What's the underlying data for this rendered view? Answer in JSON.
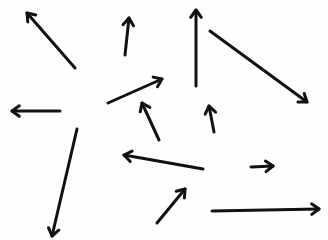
{
  "figure": {
    "background_color": "#ffffff",
    "stroke_color": "#111111",
    "arrow_count": 13
  },
  "arrows": [
    {
      "id": 1,
      "direction": "up-left",
      "tail": [
        75,
        68
      ],
      "head": [
        27,
        13
      ]
    },
    {
      "id": 2,
      "direction": "up",
      "tail": [
        125,
        55
      ],
      "head": [
        129,
        18
      ]
    },
    {
      "id": 3,
      "direction": "up",
      "tail": [
        196,
        86
      ],
      "head": [
        196,
        10
      ]
    },
    {
      "id": 4,
      "direction": "down-right",
      "tail": [
        210,
        31
      ],
      "head": [
        307,
        102
      ]
    },
    {
      "id": 5,
      "direction": "left",
      "tail": [
        60,
        111
      ],
      "head": [
        12,
        111
      ]
    },
    {
      "id": 6,
      "direction": "up-right",
      "tail": [
        108,
        103
      ],
      "head": [
        162,
        79
      ]
    },
    {
      "id": 7,
      "direction": "up-left",
      "tail": [
        159,
        140
      ],
      "head": [
        142,
        103
      ]
    },
    {
      "id": 8,
      "direction": "up",
      "tail": [
        214,
        132
      ],
      "head": [
        209,
        106
      ]
    },
    {
      "id": 9,
      "direction": "down",
      "tail": [
        77,
        129
      ],
      "head": [
        52,
        236
      ]
    },
    {
      "id": 10,
      "direction": "left",
      "tail": [
        203,
        169
      ],
      "head": [
        124,
        155
      ]
    },
    {
      "id": 11,
      "direction": "right",
      "tail": [
        251,
        167
      ],
      "head": [
        273,
        166
      ]
    },
    {
      "id": 12,
      "direction": "up-right",
      "tail": [
        157,
        223
      ],
      "head": [
        185,
        189
      ]
    },
    {
      "id": 13,
      "direction": "right",
      "tail": [
        212,
        211
      ],
      "head": [
        319,
        209
      ]
    }
  ]
}
